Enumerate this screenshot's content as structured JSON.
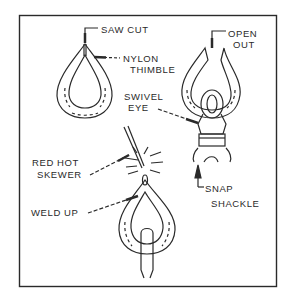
{
  "figure": {
    "type": "technical-illustration",
    "panels": [
      {
        "id": "thimble",
        "description": "Nylon thimble with saw cut at top"
      },
      {
        "id": "open-thimble",
        "description": "Thimble opened out and placed over swivel eye of snap shackle"
      },
      {
        "id": "weld",
        "description": "Cut closed with red hot skewer to weld up"
      }
    ]
  },
  "labels": {
    "saw_cut": "SAW CUT",
    "nylon": "NYLON",
    "thimble": "THIMBLE",
    "open": "OPEN",
    "out": "OUT",
    "swivel": "SWIVEL",
    "eye": "EYE",
    "snap": "SNAP",
    "shackle": "SHACKLE",
    "red_hot": "RED HOT",
    "skewer": "SKEWER",
    "weld_up": "WELD UP"
  },
  "colors": {
    "ink": "#2a2a2a",
    "background": "#ffffff"
  }
}
